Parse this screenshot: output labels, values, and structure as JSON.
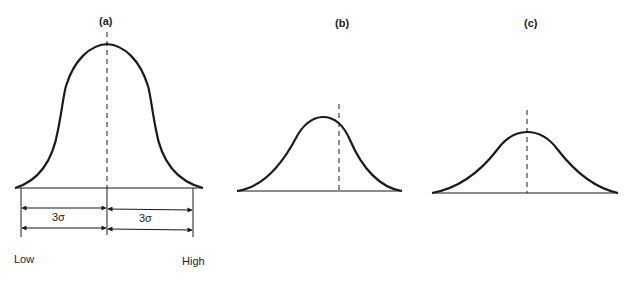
{
  "figure": {
    "panels": [
      {
        "id": "a",
        "label": "(a)",
        "shape": "broad flat-topped (platykurtic) distribution centered on mean"
      },
      {
        "id": "b",
        "label": "(b)",
        "shape": "narrow distribution with peak shifted left of the dashed center line"
      },
      {
        "id": "c",
        "label": "(c)",
        "shape": "symmetric bell curve centered on dashed line"
      }
    ],
    "panel_a": {
      "left_interval_label": "3σ",
      "right_interval_label": "3σ",
      "low_label": "Low",
      "high_label": "High"
    }
  },
  "colors": {
    "stroke": "#1a1a1a",
    "background": "#ffffff"
  }
}
